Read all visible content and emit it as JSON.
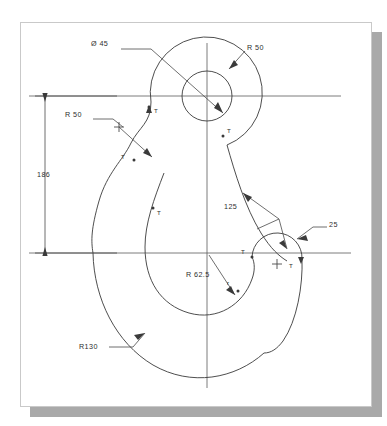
{
  "drawing": {
    "title": "Crane Hook Geometric Construction Drawing",
    "sheet": {
      "background_color": "#ffffff",
      "border_color": "#c9c9c9",
      "shadow_color": "#a9a9a9"
    },
    "line_color": "#3a3a3a",
    "axis_color": "#5a5a5a"
  },
  "dimensions": [
    {
      "id": "bore-diameter",
      "label": "Ø 45",
      "kind": "diameter",
      "value": 45,
      "feature": "eye-bore-circle"
    },
    {
      "id": "eye-outer-radius",
      "label": "R 50",
      "kind": "radius",
      "value": 50,
      "feature": "eye-outer-arc"
    },
    {
      "id": "shank-fillet-radius",
      "label": "R 50",
      "kind": "radius",
      "value": 50,
      "feature": "left-shank-fillet"
    },
    {
      "id": "overall-height",
      "label": "186",
      "kind": "linear",
      "value": 186,
      "feature": "vertical-extent"
    },
    {
      "id": "flank-radius",
      "label": "125",
      "kind": "radius",
      "value": 125,
      "feature": "right-flank-arc"
    },
    {
      "id": "tip-radius",
      "label": "25",
      "kind": "radius",
      "value": 25,
      "feature": "hook-tip-arc"
    },
    {
      "id": "throat-radius",
      "label": "R 62.5",
      "kind": "radius",
      "value": 62.5,
      "feature": "throat-arc"
    },
    {
      "id": "outer-body-radius",
      "label": "R130",
      "kind": "radius",
      "value": 130,
      "feature": "outer-body-arc"
    }
  ],
  "tangent_marks": [
    {
      "id": "tangent-upper-left",
      "label": "T"
    },
    {
      "id": "tangent-upper-right",
      "label": "T"
    },
    {
      "id": "tangent-left-shank",
      "label": "T"
    },
    {
      "id": "tangent-mid-throat",
      "label": "T"
    },
    {
      "id": "tangent-tip-upper",
      "label": "T"
    },
    {
      "id": "tangent-tip-right",
      "label": "T"
    },
    {
      "id": "tangent-lower-right",
      "label": "r"
    }
  ]
}
